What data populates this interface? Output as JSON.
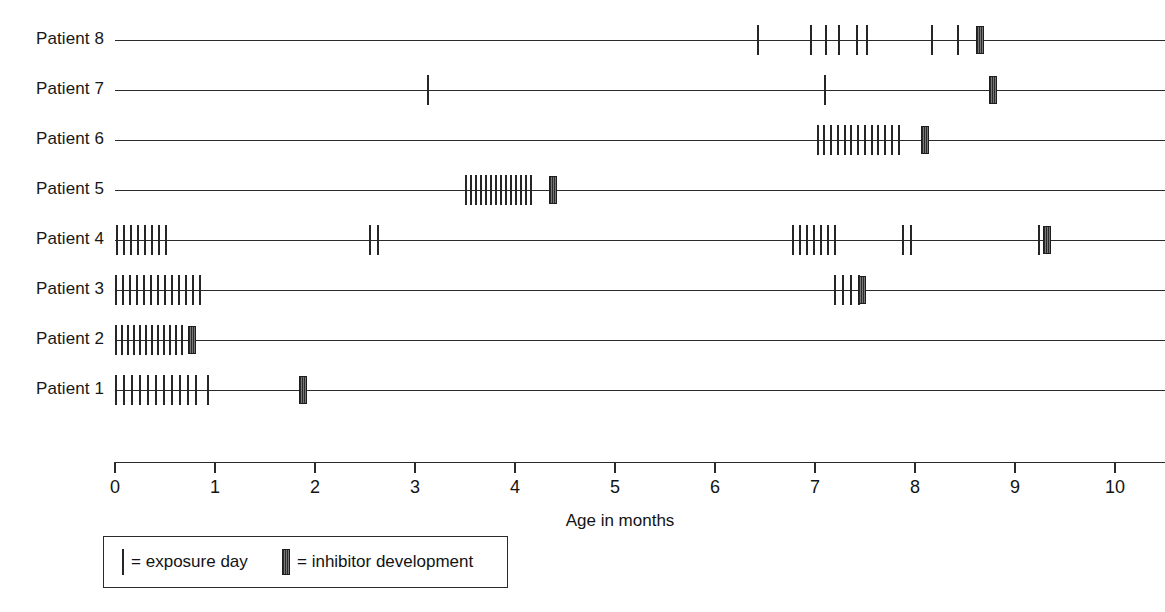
{
  "chart_data": {
    "type": "timeline",
    "title": "",
    "xlabel": "Age in months",
    "ylabel": "",
    "xlim": [
      0,
      10.5
    ],
    "xticks": [
      0,
      1,
      2,
      3,
      4,
      5,
      6,
      7,
      8,
      9,
      10
    ],
    "xtick_labels": [
      "0",
      "1",
      "2",
      "3",
      "4",
      "5",
      "6",
      "7",
      "8",
      "9",
      "10"
    ],
    "grid": false,
    "legend_position": "bottom-left",
    "legend": [
      {
        "marker": "thin-tick",
        "label": "= exposure day"
      },
      {
        "marker": "thick-hatched-bar",
        "label": "= inhibitor development"
      }
    ],
    "categories": [
      "Patient 8",
      "Patient 7",
      "Patient 6",
      "Patient 5",
      "Patient 4",
      "Patient 3",
      "Patient 2",
      "Patient 1"
    ],
    "series": [
      {
        "name": "Patient 8",
        "line_end": 10.5,
        "exposure_days": [
          6.43,
          6.96,
          7.11,
          7.24,
          7.42,
          7.52,
          8.17,
          8.43
        ],
        "inhibitor_development": 8.65
      },
      {
        "name": "Patient 7",
        "line_end": 10.5,
        "exposure_days": [
          3.13,
          7.1
        ],
        "inhibitor_development": 8.78
      },
      {
        "name": "Patient 6",
        "line_end": 10.5,
        "exposure_days": [
          7.03,
          7.09,
          7.16,
          7.23,
          7.3,
          7.36,
          7.43,
          7.5,
          7.57,
          7.63,
          7.7,
          7.77,
          7.84
        ],
        "inhibitor_development": 8.1
      },
      {
        "name": "Patient 5",
        "line_end": 10.5,
        "exposure_days": [
          3.51,
          3.56,
          3.61,
          3.66,
          3.71,
          3.76,
          3.81,
          3.86,
          3.91,
          3.96,
          4.01,
          4.06,
          4.11,
          4.16
        ],
        "inhibitor_development": 4.38
      },
      {
        "name": "Patient 4",
        "line_end": 10.5,
        "exposure_days": [
          0.02,
          0.09,
          0.16,
          0.23,
          0.3,
          0.37,
          0.44,
          0.51,
          2.55,
          2.63,
          6.78,
          6.85,
          6.92,
          6.99,
          7.06,
          7.13,
          7.2,
          7.88,
          7.96,
          9.24
        ],
        "inhibitor_development": 9.32
      },
      {
        "name": "Patient 3",
        "line_end": 10.5,
        "exposure_days": [
          0.01,
          0.08,
          0.15,
          0.22,
          0.29,
          0.36,
          0.43,
          0.5,
          0.57,
          0.64,
          0.71,
          0.78,
          0.85,
          7.2,
          7.28,
          7.36,
          7.44
        ],
        "inhibitor_development": 7.47
      },
      {
        "name": "Patient 2",
        "line_end": 10.5,
        "exposure_days": [
          0.01,
          0.07,
          0.13,
          0.19,
          0.25,
          0.31,
          0.37,
          0.43,
          0.49,
          0.55,
          0.61,
          0.67
        ],
        "inhibitor_development": 0.77
      },
      {
        "name": "Patient 1",
        "line_end": 10.5,
        "exposure_days": [
          0.01,
          0.09,
          0.17,
          0.25,
          0.33,
          0.41,
          0.49,
          0.57,
          0.65,
          0.73,
          0.81,
          0.93
        ],
        "inhibitor_development": 1.88
      }
    ]
  },
  "layout": {
    "plot_left_px": 115,
    "px_per_month": 100,
    "row_top_px": 40,
    "row_step_px": 50,
    "axis_y_px": 462,
    "tick_height_px": 30,
    "bar_height_px": 28
  }
}
